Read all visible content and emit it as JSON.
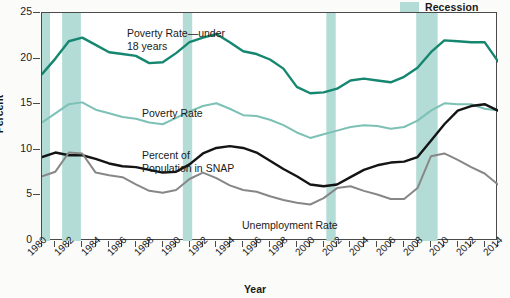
{
  "legend": {
    "label": "Recession",
    "swatch_color": "#b4dcd6"
  },
  "axes": {
    "ylabel": "Percent",
    "xlabel": "Year",
    "yticks": [
      "0",
      "5",
      "10",
      "15",
      "20",
      "25"
    ],
    "ylim": [
      0,
      25
    ],
    "xlim": [
      1980,
      2014
    ],
    "xticks": [
      "1980",
      "1981",
      "1982",
      "1983",
      "1984",
      "1985",
      "1986",
      "1987",
      "1988",
      "1989",
      "1990",
      "1991",
      "1992",
      "1993",
      "1994",
      "1995",
      "1996",
      "1997",
      "1998",
      "1999",
      "2000",
      "2001",
      "2002",
      "2003",
      "2004",
      "2005",
      "2006",
      "2007",
      "2008",
      "2009",
      "2010",
      "2011",
      "2012",
      "2013",
      "2014"
    ],
    "xtick_labels": [
      "1980",
      "1982",
      "1984",
      "1986",
      "1988",
      "1990",
      "1992",
      "1994",
      "1996",
      "1998",
      "2000",
      "2002",
      "2004",
      "2006",
      "2008",
      "2010",
      "2012",
      "2014"
    ]
  },
  "annotations": {
    "child_poverty": "Poverty Rate—under\n18 years",
    "poverty": "Poverty Rate",
    "snap": "Percent of\nPopulation in SNAP",
    "unemployment": "Unemployment Rate"
  },
  "colors": {
    "child_poverty": "#15866f",
    "poverty": "#7cc0b6",
    "snap": "#141414",
    "unemployment": "#878787",
    "recession": "#b4dcd6",
    "axis": "#4a4a4a"
  },
  "chart_data": {
    "type": "line",
    "title": "",
    "xlabel": "Year",
    "ylabel": "Percent",
    "ylim": [
      0,
      25
    ],
    "xlim": [
      1980,
      2014
    ],
    "grid": false,
    "legend_position": "top-right",
    "x": [
      1980,
      1981,
      1982,
      1983,
      1984,
      1985,
      1986,
      1987,
      1988,
      1989,
      1990,
      1991,
      1992,
      1993,
      1994,
      1995,
      1996,
      1997,
      1998,
      1999,
      2000,
      2001,
      2002,
      2003,
      2004,
      2005,
      2006,
      2007,
      2008,
      2009,
      2010,
      2011,
      2012,
      2013,
      2014
    ],
    "series": [
      {
        "name": "Poverty Rate—under 18 years",
        "color": "#15866f",
        "values": [
          18.3,
          20.0,
          21.9,
          22.3,
          21.5,
          20.7,
          20.5,
          20.3,
          19.5,
          19.6,
          20.6,
          21.8,
          22.3,
          22.7,
          21.8,
          20.8,
          20.5,
          19.9,
          18.9,
          16.9,
          16.2,
          16.3,
          16.7,
          17.6,
          17.8,
          17.6,
          17.4,
          18.0,
          19.0,
          20.7,
          22.0,
          21.9,
          21.8,
          21.8,
          19.7
        ]
      },
      {
        "name": "Poverty Rate",
        "color": "#7cc0b6",
        "values": [
          13.0,
          14.0,
          15.0,
          15.2,
          14.4,
          14.0,
          13.6,
          13.4,
          13.0,
          12.8,
          13.5,
          14.2,
          14.8,
          15.1,
          14.5,
          13.8,
          13.7,
          13.3,
          12.7,
          11.9,
          11.3,
          11.7,
          12.1,
          12.5,
          12.7,
          12.6,
          12.3,
          12.5,
          13.2,
          14.3,
          15.1,
          15.0,
          15.0,
          14.5,
          14.3
        ]
      },
      {
        "name": "Percent of Population in SNAP",
        "color": "#141414",
        "values": [
          9.2,
          9.7,
          9.4,
          9.4,
          9.0,
          8.5,
          8.2,
          8.1,
          7.8,
          7.5,
          7.6,
          8.4,
          9.6,
          10.2,
          10.4,
          10.2,
          9.7,
          8.8,
          7.9,
          7.1,
          6.2,
          6.0,
          6.2,
          7.0,
          7.8,
          8.3,
          8.6,
          8.7,
          9.2,
          11.0,
          12.8,
          14.3,
          14.8,
          15.0,
          14.3
        ]
      },
      {
        "name": "Unemployment Rate",
        "color": "#878787",
        "values": [
          7.1,
          7.6,
          9.7,
          9.6,
          7.5,
          7.2,
          7.0,
          6.2,
          5.5,
          5.3,
          5.6,
          6.8,
          7.5,
          6.9,
          6.1,
          5.6,
          5.4,
          4.9,
          4.5,
          4.2,
          4.0,
          4.7,
          5.8,
          6.0,
          5.5,
          5.1,
          4.6,
          4.6,
          5.8,
          9.3,
          9.6,
          8.9,
          8.1,
          7.4,
          6.2
        ]
      }
    ],
    "recessions": [
      {
        "start": 1980.0,
        "end": 1980.6
      },
      {
        "start": 1981.5,
        "end": 1982.9
      },
      {
        "start": 1990.5,
        "end": 1991.2
      },
      {
        "start": 2001.2,
        "end": 2001.9
      },
      {
        "start": 2007.9,
        "end": 2009.5
      }
    ]
  }
}
